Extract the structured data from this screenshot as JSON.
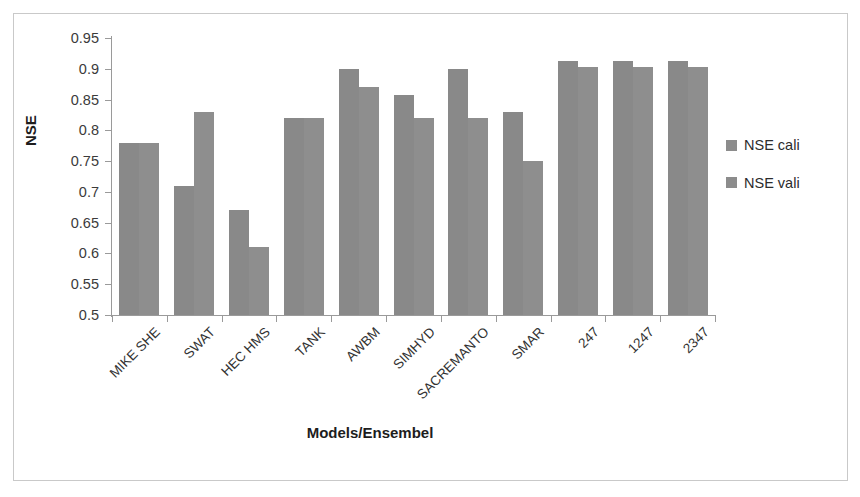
{
  "chart_data": {
    "type": "bar",
    "title": "",
    "xlabel": "Models/Ensembel",
    "ylabel": "NSE",
    "ylim": [
      0.5,
      0.95
    ],
    "ytick_labels": [
      "0.95",
      "0.9",
      "0.85",
      "0.8",
      "0.75",
      "0.7",
      "0.65",
      "0.6",
      "0.55",
      "0.5"
    ],
    "ytick_values": [
      0.95,
      0.9,
      0.85,
      0.8,
      0.75,
      0.7,
      0.65,
      0.6,
      0.55,
      0.5
    ],
    "grid": false,
    "legend_position": "right",
    "categories": [
      "MIKE SHE",
      "SWAT",
      "HEC HMS",
      "TANK",
      "AWBM",
      "SIMHYD",
      "SACREMANTO",
      "SMAR",
      "247",
      "1247",
      "2347"
    ],
    "series": [
      {
        "name": "NSE cali",
        "color": "#898989",
        "values": [
          0.78,
          0.71,
          0.67,
          0.82,
          0.9,
          0.857,
          0.9,
          0.83,
          0.912,
          0.912,
          0.912
        ]
      },
      {
        "name": "NSE vali",
        "color": "#8e8e8e",
        "values": [
          0.78,
          0.83,
          0.61,
          0.82,
          0.87,
          0.82,
          0.82,
          0.75,
          0.903,
          0.903,
          0.903
        ]
      }
    ]
  },
  "legend": {
    "entries": [
      {
        "label": "NSE cali",
        "swatch_color": "#8c8c8c"
      },
      {
        "label": "NSE vali",
        "swatch_color": "#8c8c8c"
      }
    ]
  },
  "axes": {
    "y_title": "NSE",
    "x_title": "Models/Ensembel"
  },
  "style": {
    "bar_color": "#898989",
    "axis_color": "#9a9a9a",
    "frame_color": "#c9c9c9",
    "text_color": "#333333"
  }
}
